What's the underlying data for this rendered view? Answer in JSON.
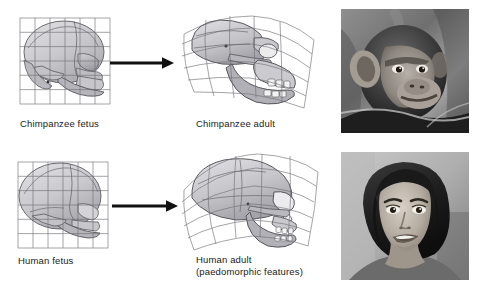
{
  "figure": {
    "background_color": "#ffffff",
    "width": 483,
    "height": 295
  },
  "panels": [
    {
      "id": "chimp-fetus",
      "caption": "Chimpanzee fetus",
      "kind": "skull-diagram",
      "grid": "regular",
      "grid_rows": 6,
      "grid_cols": 6,
      "species": "chimpanzee",
      "stage": "fetus"
    },
    {
      "id": "chimp-adult",
      "caption": "Chimpanzee adult",
      "kind": "skull-diagram",
      "grid": "deformed",
      "grid_rows": 6,
      "grid_cols": 6,
      "species": "chimpanzee",
      "stage": "adult"
    },
    {
      "id": "human-fetus",
      "caption": "Human fetus",
      "kind": "skull-diagram",
      "grid": "regular",
      "grid_rows": 6,
      "grid_cols": 6,
      "species": "human",
      "stage": "fetus"
    },
    {
      "id": "human-adult",
      "caption": "Human adult\n(paedomorphic features)",
      "kind": "skull-diagram",
      "grid": "deformed",
      "grid_rows": 6,
      "grid_cols": 6,
      "species": "human",
      "stage": "adult"
    }
  ],
  "arrows": [
    {
      "id": "arrow-chimp",
      "direction": "right",
      "label": "transforms into"
    },
    {
      "id": "arrow-human",
      "direction": "right",
      "label": "transforms into"
    }
  ],
  "photos": [
    {
      "id": "chimp-photo",
      "subject": "chimpanzee",
      "description": "Black and white photograph of a juvenile chimpanzee in profile",
      "color_mode": "grayscale"
    },
    {
      "id": "human-photo",
      "subject": "human",
      "description": "Black and white photograph of a smiling young woman",
      "color_mode": "grayscale"
    }
  ],
  "colors": {
    "grid_line": "#6e6e74",
    "skull_outline": "#5a5a60",
    "skull_fill_light": "#d8d8da",
    "skull_fill_mid": "#bdbdc2",
    "skull_fill_dark": "#9b9ba1",
    "arrow": "#101010",
    "text": "#1a1a1a"
  }
}
